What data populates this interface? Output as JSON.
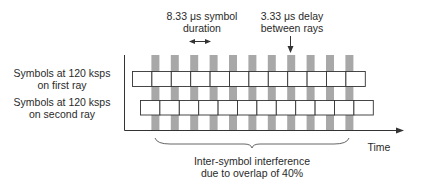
{
  "diagram": {
    "annotations": {
      "symbol_duration": [
        "8.33 μs symbol",
        "duration"
      ],
      "ray_delay": [
        "3.33 μs delay",
        "between rays"
      ],
      "isi": [
        "Inter-symbol interference",
        "due to overlap of 40%"
      ]
    },
    "rows": [
      {
        "label": [
          "Symbols at 120 ksps",
          "on first ray"
        ],
        "symbol_count": 12,
        "start_x": 132
      },
      {
        "label": [
          "Symbols at 120 ksps",
          "on second ray"
        ],
        "symbol_count": 12,
        "start_x": 140
      }
    ],
    "axis": {
      "x_label": "Time"
    },
    "symbol_width_px": 19.4,
    "overlap_bar_count": 11,
    "colors": {
      "line": "#333333",
      "overlap_bar": "#a8a8a8",
      "box_fill": "#ffffff"
    }
  }
}
